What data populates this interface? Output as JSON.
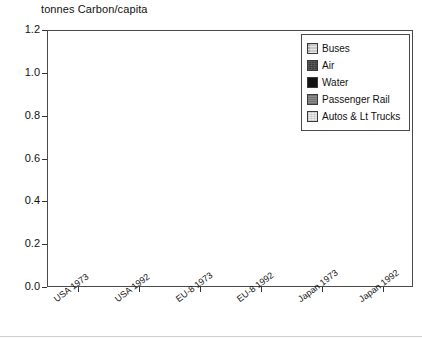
{
  "chart_data": {
    "type": "bar",
    "subtype": "stacked-vertical",
    "title": "tonnes Carbon/capita",
    "xlabel": "",
    "ylabel": "tonnes Carbon/capita",
    "ylim": [
      0.0,
      1.2
    ],
    "yticks": [
      "0.0",
      "0.2",
      "0.4",
      "0.6",
      "0.8",
      "1.0",
      "1.2"
    ],
    "ytick_values": [
      0.0,
      0.2,
      0.4,
      0.6,
      0.8,
      1.0,
      1.2
    ],
    "grid": "horizontal-dotted",
    "legend_position": "top-right",
    "categories": [
      "USA 1973",
      "USA 1992",
      "EU-8 1973",
      "EU-8 1992",
      "Japan 1973",
      "Japan 1992"
    ],
    "stack_order_bottom_to_top": [
      "Autos & Lt Trucks",
      "Passenger Rail",
      "Water",
      "Air",
      "Buses"
    ],
    "series": [
      {
        "name": "Autos & Lt Trucks",
        "color": "#ededed",
        "values": [
          0.975,
          0.875,
          0.205,
          0.335,
          0.118,
          0.21
        ]
      },
      {
        "name": "Passenger Rail",
        "color": "#8e8e8e",
        "values": [
          0.005,
          0.005,
          0.01,
          0.008,
          0.012,
          0.012
        ]
      },
      {
        "name": "Water",
        "color": "#121212",
        "values": [
          0.005,
          0.005,
          0.012,
          0.01,
          0.03,
          0.04
        ]
      },
      {
        "name": "Air",
        "color": "#3d3d3d",
        "values": [
          0.105,
          0.11,
          0.008,
          0.005,
          0.008,
          0.013
        ]
      },
      {
        "name": "Buses",
        "color": "#c9c9c9",
        "values": [
          0.03,
          0.045,
          0.03,
          0.052,
          0.027,
          0.03
        ]
      }
    ],
    "totals": [
      1.12,
      1.04,
      0.265,
      0.41,
      0.195,
      0.305
    ]
  },
  "axis": {
    "title": "tonnes Carbon/capita",
    "y_ticks": [
      "1.2",
      "1.0",
      "0.8",
      "0.6",
      "0.4",
      "0.2",
      "0.0"
    ],
    "x_ticks": [
      "USA 1973",
      "USA 1992",
      "EU-8 1973",
      "EU-8 1992",
      "Japan 1973",
      "Japan 1992"
    ]
  },
  "legend": {
    "items": [
      {
        "label": "Buses",
        "swatch": "buses-swatch",
        "color": "#c9c9c9"
      },
      {
        "label": "Air",
        "swatch": "air-swatch",
        "color": "#3d3d3d"
      },
      {
        "label": "Water",
        "swatch": "water-swatch",
        "color": "#121212"
      },
      {
        "label": "Passenger Rail",
        "swatch": "rail-swatch",
        "color": "#8e8e8e"
      },
      {
        "label": "Autos & Lt Trucks",
        "swatch": "autos-swatch",
        "color": "#ededed"
      }
    ]
  }
}
